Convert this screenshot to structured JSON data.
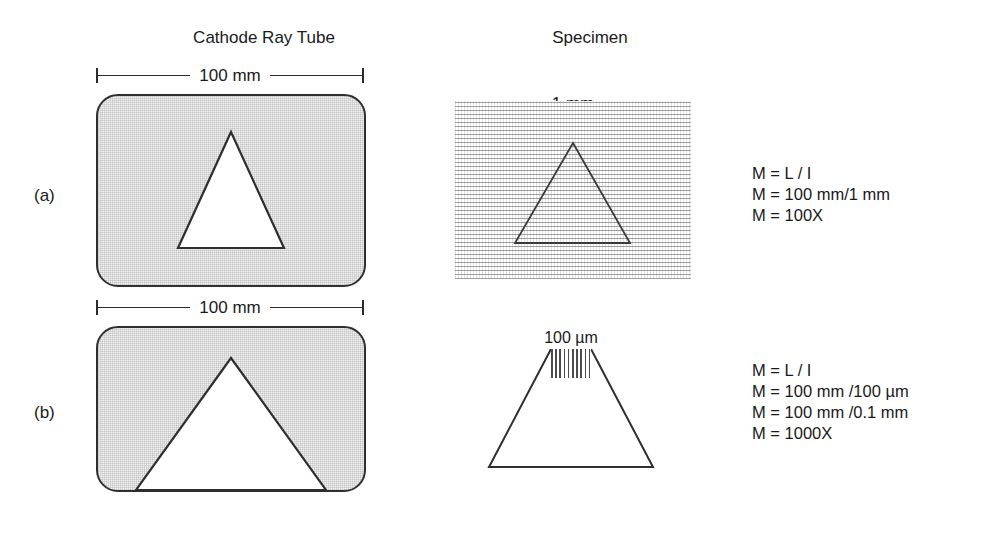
{
  "figure": {
    "headings": {
      "crt": "Cathode Ray Tube",
      "specimen": "Specimen"
    },
    "panels": [
      {
        "letter": "(a)",
        "crt": {
          "dimension_label": "100 mm",
          "shape": "triangle"
        },
        "specimen": {
          "dimension_label": "1 mm",
          "shape": "triangle",
          "texture": "horizontal-stripes"
        },
        "formula": {
          "lines": [
            "M = L / I",
            "M = 100 mm/1 mm",
            "M = 100X"
          ]
        }
      },
      {
        "letter": "(b)",
        "crt": {
          "dimension_label": "100 mm",
          "shape": "triangle"
        },
        "specimen": {
          "dimension_label": "100 µm",
          "shape": "truncated-triangle",
          "texture": "vertical-hatch"
        },
        "formula": {
          "lines": [
            "M = L / I",
            "M = 100 mm /100 µm",
            "M = 100 mm /0.1 mm",
            "M = 1000X"
          ]
        }
      }
    ],
    "colors": {
      "ink": "#1a1a1a",
      "outline": "#2f2f2f",
      "screen_fill": "#f2f2f2",
      "texture": "#696969"
    }
  }
}
